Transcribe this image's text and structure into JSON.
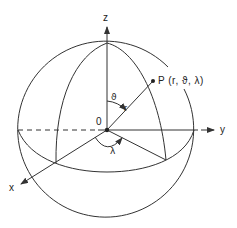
{
  "diagram": {
    "axes": {
      "z_label": "z",
      "y_label": "y",
      "x_label": "x"
    },
    "origin_label": "0",
    "point_label": "P (r, ϑ, λ)",
    "radius_label": "r",
    "polar_angle_label": "ϑ",
    "azimuth_angle_label": "λ",
    "colors": {
      "stroke": "#333333",
      "background": "#ffffff"
    }
  }
}
